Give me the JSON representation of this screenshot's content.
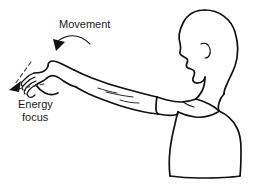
{
  "figure": {
    "background_color": "#ffffff",
    "ink_color": "#111111",
    "width": 257,
    "height": 185
  },
  "labels": {
    "movement": "Movement",
    "energy_line1": "Energy",
    "energy_line2": "focus"
  },
  "annotations": {
    "movement_arrow": "curved-solid-arrow-down-left",
    "energy_arrow_upper": "dashed-arrow-down-left",
    "energy_arrow_lower": "dashed-arrow-left"
  },
  "subject": {
    "parts": [
      "head-profile-facing-left",
      "ear",
      "neck",
      "torso-in-tshirt",
      "shirt-sleeve",
      "extended-left-arm",
      "forearm-muscle-lines",
      "hand-flexed-down",
      "four-fingers"
    ]
  }
}
